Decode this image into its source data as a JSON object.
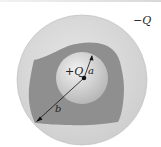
{
  "diagram": {
    "type": "charged-sphere-inside-conducting-shell",
    "labels": {
      "outer_charge": "−Q",
      "inner_charge": "+Q",
      "inner_radius": "a",
      "outer_distance": "b"
    },
    "colors": {
      "outer_sphere": "#d9d9d9",
      "conductor_cavity": "#8e8e8e",
      "inner_sphere": "#cfcfcf",
      "lines": "#111111"
    }
  }
}
